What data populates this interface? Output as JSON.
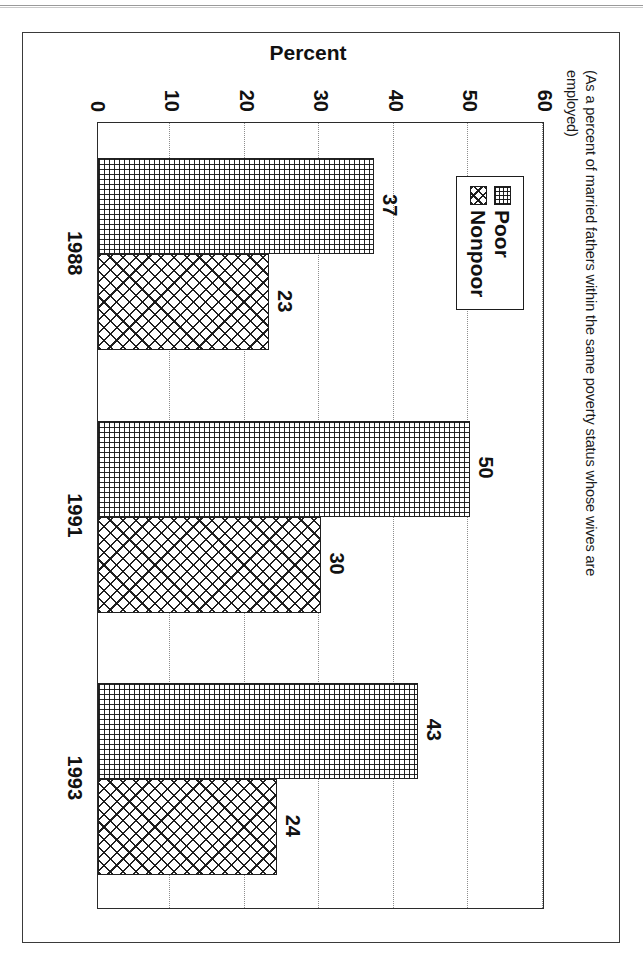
{
  "page": {
    "background": "#ffffff",
    "frame_color": "#3a3a3a"
  },
  "chart_data": {
    "type": "bar",
    "title": "",
    "subtitle_line1": "(As a percent of married fathers within the same poverty status whose wives are",
    "subtitle_line2": "employed)",
    "categories": [
      "1988",
      "1991",
      "1993"
    ],
    "series": [
      {
        "name": "Poor",
        "values": [
          37,
          50,
          43
        ],
        "pattern": "fine-grid"
      },
      {
        "name": "Nonpoor",
        "values": [
          23,
          30,
          24
        ],
        "pattern": "diagonal-crosshatch"
      }
    ],
    "xlabel": "",
    "ylabel": "Percent",
    "ylim": [
      0,
      60
    ],
    "yticks": [
      0,
      10,
      20,
      30,
      40,
      50,
      60
    ],
    "ytick_labels": [
      "0",
      "10",
      "20",
      "30",
      "40",
      "50",
      "60"
    ],
    "grid": true,
    "grid_orientation": "horizontal",
    "grid_style": "dotted",
    "legend_position": "top-left",
    "data_labels": true,
    "orientation": "page-rotated-90-clockwise",
    "bar_colors": {
      "poor": "#ffffff",
      "nonpoor": "#ffffff",
      "outline": "#202020"
    }
  },
  "legend": {
    "entries": [
      {
        "label": "Poor"
      },
      {
        "label": "Nonpoor"
      }
    ]
  },
  "axes": {
    "y_title": "Percent",
    "y_ticks": [
      "60",
      "50",
      "40",
      "30",
      "20",
      "10",
      "0"
    ],
    "x_ticks": [
      "1988",
      "1991",
      "1993"
    ]
  },
  "bar_labels": {
    "y1988_poor": "37",
    "y1988_nonpoor": "23",
    "y1991_poor": "50",
    "y1991_nonpoor": "30",
    "y1993_poor": "43",
    "y1993_nonpoor": "24"
  }
}
